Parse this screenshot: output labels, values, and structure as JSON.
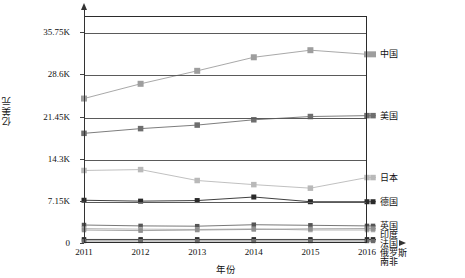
{
  "axes": {
    "y_title": "亿美元",
    "x_title": "年份",
    "y_ticks": [
      "0",
      "7.15K",
      "14.3K",
      "21.45K",
      "28.6K",
      "35.75K"
    ],
    "x_ticks": [
      "2011",
      "2012",
      "2013",
      "2014",
      "2015",
      "2016"
    ]
  },
  "colors": {
    "china": "#9e9e9e",
    "usa": "#6e6e6e",
    "japan": "#b9b9b9",
    "germany": "#2a2a2a",
    "uk": "#555555",
    "france": "#a8a8a8",
    "india": "#8f8f8f",
    "russia": "#141414",
    "southafrica": "#6a6a6a",
    "axis": "#2b2b2b",
    "grid": "#5a5a5a",
    "text": "#111111"
  },
  "chart_data": {
    "type": "line",
    "title": "",
    "xlabel": "年份",
    "ylabel": "亿美元",
    "x": [
      "2011",
      "2012",
      "2013",
      "2014",
      "2015",
      "2016"
    ],
    "ylim": [
      0,
      38500
    ],
    "ytick_values": [
      0,
      7150,
      14300,
      21450,
      28600,
      35750
    ],
    "grid": true,
    "legend_position": "right-inline",
    "series": [
      {
        "name": "中国",
        "values": [
          24500,
          27000,
          29200,
          31500,
          32700,
          32000
        ]
      },
      {
        "name": "美国",
        "values": [
          18600,
          19400,
          20000,
          20900,
          21450,
          21600
        ]
      },
      {
        "name": "日本",
        "values": [
          12300,
          12450,
          10600,
          9900,
          9300,
          11100
        ]
      },
      {
        "name": "德国",
        "values": [
          7250,
          7100,
          7200,
          7800,
          7000,
          7000
        ]
      },
      {
        "name": "英国",
        "values": [
          3050,
          2900,
          2850,
          3100,
          3000,
          2900
        ]
      },
      {
        "name": "法国",
        "values": [
          2450,
          2350,
          2300,
          2400,
          2200,
          2200
        ]
      },
      {
        "name": "印度",
        "values": [
          2200,
          2100,
          2200,
          2300,
          2400,
          2450
        ]
      },
      {
        "name": "俄罗斯",
        "values": [
          600,
          600,
          600,
          600,
          600,
          600
        ]
      },
      {
        "name": "南非",
        "values": [
          350,
          350,
          350,
          350,
          350,
          350
        ]
      }
    ]
  }
}
